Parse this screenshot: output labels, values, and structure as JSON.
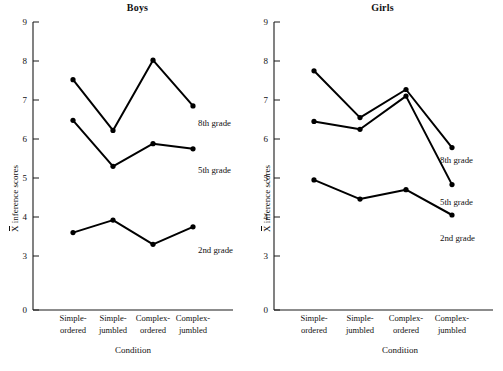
{
  "figure": {
    "background_color": "#ffffff",
    "line_color": "#000000",
    "axis_color": "#1a1a1a",
    "y_axis_title_prefix": "X",
    "y_axis_title_rest": " inference scores",
    "x_axis_title": "Condition"
  },
  "chart_data": [
    {
      "type": "line",
      "title": "Boys",
      "xlabel": "Condition",
      "ylabel": "X̄ inference scores",
      "categories": [
        "Simple-ordered",
        "Simple-jumbled",
        "Complex-ordered",
        "Complex-jumbled"
      ],
      "category_lines": [
        [
          "Simple-",
          "ordered"
        ],
        [
          "Simple-",
          "jumbled"
        ],
        [
          "Complex-",
          "ordered"
        ],
        [
          "Complex-",
          "jumbled"
        ]
      ],
      "ylim": [
        0,
        9
      ],
      "yticks": [
        0,
        3,
        4,
        5,
        6,
        7,
        8,
        9
      ],
      "ytick_labels": [
        "0",
        "3",
        "4",
        "5",
        "6",
        "7",
        "8",
        "9"
      ],
      "grid": false,
      "legend_position": "inline-right-of-last-point",
      "series": [
        {
          "name": "8th grade",
          "values": [
            7.52,
            6.22,
            8.02,
            6.85
          ]
        },
        {
          "name": "5th grade",
          "values": [
            6.48,
            5.3,
            5.88,
            5.75
          ]
        },
        {
          "name": "2nd grade",
          "values": [
            3.6,
            3.92,
            3.3,
            3.75
          ]
        }
      ]
    },
    {
      "type": "line",
      "title": "Girls",
      "xlabel": "Condition",
      "ylabel": "X̄ inference scores",
      "categories": [
        "Simple-ordered",
        "Simple-jumbled",
        "Complex-ordered",
        "Complex-jumbled"
      ],
      "category_lines": [
        [
          "Simple-",
          "ordered"
        ],
        [
          "Simple-",
          "jumbled"
        ],
        [
          "Complex-",
          "ordered"
        ],
        [
          "Complex-",
          "jumbled"
        ]
      ],
      "ylim": [
        0,
        9
      ],
      "yticks": [
        0,
        3,
        4,
        5,
        6,
        7,
        8,
        9
      ],
      "ytick_labels": [
        "0",
        "3",
        "4",
        "5",
        "6",
        "7",
        "8",
        "9"
      ],
      "grid": false,
      "legend_position": "inline-right-of-last-point",
      "series": [
        {
          "name": "8th grade",
          "values": [
            7.75,
            6.55,
            7.27,
            5.78
          ]
        },
        {
          "name": "5th grade",
          "values": [
            6.45,
            6.25,
            7.1,
            4.83
          ]
        },
        {
          "name": "2nd grade",
          "values": [
            4.95,
            4.46,
            4.7,
            4.05
          ]
        }
      ]
    }
  ],
  "panels": {
    "boys": {
      "title": "Boys",
      "ytick_labels": [
        "9",
        "8",
        "7",
        "6",
        "5",
        "4",
        "3",
        "0"
      ],
      "categories": [
        {
          "line1": "Simple-",
          "line2": "ordered"
        },
        {
          "line1": "Simple-",
          "line2": "jumbled"
        },
        {
          "line1": "Complex-",
          "line2": "ordered"
        },
        {
          "line1": "Complex-",
          "line2": "jumbled"
        }
      ],
      "series_labels": [
        "8th grade",
        "5th grade",
        "2nd grade"
      ],
      "x_axis_title": "Condition",
      "y_axis_title_prefix": "X",
      "y_axis_title_rest": " inference scores"
    },
    "girls": {
      "title": "Girls",
      "ytick_labels": [
        "9",
        "8",
        "7",
        "6",
        "5",
        "4",
        "3",
        "0"
      ],
      "categories": [
        {
          "line1": "Simple-",
          "line2": "ordered"
        },
        {
          "line1": "Simple-",
          "line2": "jumbled"
        },
        {
          "line1": "Complex-",
          "line2": "ordered"
        },
        {
          "line1": "Complex-",
          "line2": "jumbled"
        }
      ],
      "series_labels": [
        "8th grade",
        "5th grade",
        "2nd grade"
      ],
      "x_axis_title": "Condition",
      "y_axis_title_prefix": "X",
      "y_axis_title_rest": " inference scores"
    }
  }
}
